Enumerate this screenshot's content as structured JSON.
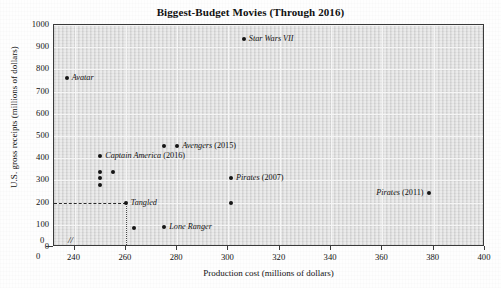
{
  "chart_data": {
    "type": "scatter",
    "title": "Biggest-Budget Movies (Through 2016)",
    "xlabel": "Production cost (millions of dollars)",
    "ylabel": "U.S. gross receipts (millions of dollars)",
    "xlim": [
      232,
      400
    ],
    "ylim": [
      0,
      1000
    ],
    "x_origin_label": "0",
    "x_axis_break": "//",
    "xticks": [
      240,
      260,
      280,
      300,
      320,
      340,
      360,
      380,
      400
    ],
    "yticks": [
      0,
      100,
      200,
      300,
      400,
      500,
      600,
      700,
      800,
      900,
      1000
    ],
    "grid": true,
    "legend": "none",
    "guides": [
      {
        "type": "horizontal-dashed",
        "y": 200,
        "from_x": 232,
        "to_x": 260
      },
      {
        "type": "vertical-dotted",
        "x": 260,
        "from_y": 0,
        "to_y": 200
      }
    ],
    "points": [
      {
        "label": "Avatar",
        "x": 237,
        "y": 760,
        "label_pos": "right"
      },
      {
        "label": "Star Wars VII",
        "x": 306,
        "y": 935,
        "label_pos": "right"
      },
      {
        "label": "Avengers (2015)",
        "x": 280,
        "y": 455,
        "label_pos": "right"
      },
      {
        "label": "",
        "x": 275,
        "y": 455,
        "label_pos": "right"
      },
      {
        "label": "Captain America (2016)",
        "x": 250,
        "y": 410,
        "label_pos": "right"
      },
      {
        "label": "",
        "x": 255,
        "y": 340,
        "label_pos": "right"
      },
      {
        "label": "",
        "x": 250,
        "y": 338,
        "label_pos": "right"
      },
      {
        "label": "",
        "x": 250,
        "y": 310,
        "label_pos": "right"
      },
      {
        "label": "",
        "x": 250,
        "y": 278,
        "label_pos": "right"
      },
      {
        "label": "Pirates (2007)",
        "x": 301,
        "y": 310,
        "label_pos": "right"
      },
      {
        "label": "Tangled",
        "x": 260,
        "y": 200,
        "label_pos": "right"
      },
      {
        "label": "",
        "x": 301,
        "y": 200,
        "label_pos": "right"
      },
      {
        "label": "Pirates (2011)",
        "x": 378,
        "y": 241,
        "label_pos": "left"
      },
      {
        "label": "Lone Ranger",
        "x": 275,
        "y": 89,
        "label_pos": "right"
      },
      {
        "label": "",
        "x": 263,
        "y": 85,
        "label_pos": "right"
      }
    ]
  }
}
